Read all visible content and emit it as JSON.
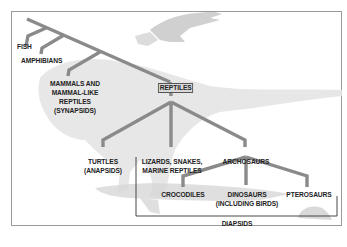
{
  "diagram": {
    "type": "phylogenetic-tree",
    "colors": {
      "branch": "#8a8a8a",
      "frame": "#9a9a9a",
      "bracket": "#333333",
      "highlight_bg": "#d9d9d9"
    },
    "nodes": {
      "fish": "FISH",
      "amphibians": "AMPHIBIANS",
      "synapsids": [
        "MAMMALS AND",
        "MAMMAL-LIKE",
        "REPTILES",
        "(SYNAPSIDS)"
      ],
      "reptiles": "REPTILES",
      "turtles": [
        "TURTLES",
        "(ANAPSIDS)"
      ],
      "lizards": [
        "LIZARDS, SNAKES,",
        "MARINE REPTILES"
      ],
      "archosaurs": "ARCHOSAURS",
      "crocodiles": "CROCODILES",
      "dinosaurs": [
        "DINOSAURS",
        "(INCLUDING BIRDS)"
      ],
      "pterosaurs": "PTEROSAURS",
      "diapsids": "DIAPSIDS"
    },
    "background_illustrations": [
      "eagle",
      "dinosaur",
      "crocodile",
      "small-reptile"
    ]
  }
}
